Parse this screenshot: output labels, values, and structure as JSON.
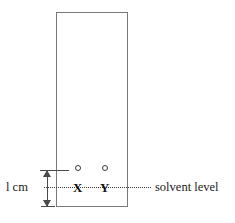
{
  "figure": {
    "colors": {
      "plate_border": "#7a7a7a",
      "solvent_line": "#3d3d3d",
      "dimension": "#4a4a4a",
      "text": "#1a1a1a",
      "spot_outline": "#3a3a3a",
      "background": "#ffffff"
    }
  },
  "plate": {
    "name": "chromatography-plate",
    "shape": "rectangle"
  },
  "dimension": {
    "label": "l cm",
    "value": 1,
    "unit": "cm",
    "description": "distance from bottom of plate to solvent level"
  },
  "solvent": {
    "label": "solvent level",
    "line_style": "dotted"
  },
  "spots": [
    {
      "letter": "X",
      "marker": "open-circle"
    },
    {
      "letter": "Y",
      "marker": "open-circle"
    }
  ]
}
